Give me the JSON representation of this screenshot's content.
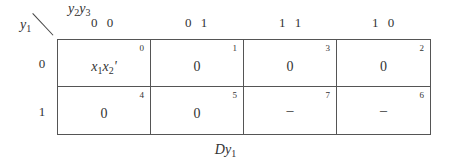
{
  "kmap": {
    "row_variable": "y",
    "row_variable_sub": "1",
    "col_variables": [
      {
        "name": "y",
        "sub": "2"
      },
      {
        "name": "y",
        "sub": "3"
      }
    ],
    "col_headers": [
      "0 0",
      "0 1",
      "1 1",
      "1 0"
    ],
    "row_headers": [
      "0",
      "1"
    ],
    "cells": [
      [
        {
          "index": "0",
          "value": "x₁x₂'"
        },
        {
          "index": "1",
          "value": "0"
        },
        {
          "index": "3",
          "value": "0"
        },
        {
          "index": "2",
          "value": "0"
        }
      ],
      [
        {
          "index": "4",
          "value": "0"
        },
        {
          "index": "5",
          "value": "0"
        },
        {
          "index": "7",
          "value": "–"
        },
        {
          "index": "6",
          "value": "–"
        }
      ]
    ],
    "caption_main": "D",
    "caption_var": "y",
    "caption_sub": "1"
  }
}
